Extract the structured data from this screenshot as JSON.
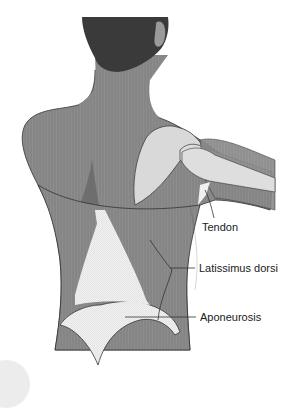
{
  "figure": {
    "colors": {
      "skin": "#8c8c8c",
      "skin_dark": "#7a7a7a",
      "hair": "#3a3a3a",
      "bone": "#d9d9d9",
      "aponeurosis": "#f2f2f2",
      "outline": "#333333",
      "leader_line": "#333333"
    }
  },
  "labels": [
    {
      "id": "tendon",
      "text": "Tendon"
    },
    {
      "id": "latissimus",
      "text": "Latissimus dorsi"
    },
    {
      "id": "aponeurosis",
      "text": "Aponeurosis"
    }
  ]
}
